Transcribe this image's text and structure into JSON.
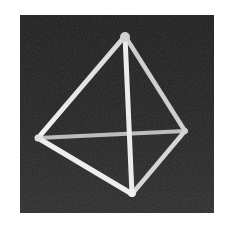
{
  "image": {
    "subject": "wireframe tetrahedron",
    "alt": "Photograph of a white wireframe tetrahedron (triangular pyramid) on a dark background",
    "background_color": "#222222",
    "frame_color": "#ffffff",
    "rod_color": "#e8e8e8"
  },
  "tetrahedron": {
    "vertices": {
      "top": [
        105,
        21
      ],
      "left": [
        18,
        123
      ],
      "right": [
        165,
        116
      ],
      "bottom": [
        112,
        179
      ]
    },
    "edges": [
      [
        "top",
        "left"
      ],
      [
        "top",
        "right"
      ],
      [
        "top",
        "bottom"
      ],
      [
        "left",
        "right"
      ],
      [
        "left",
        "bottom"
      ],
      [
        "right",
        "bottom"
      ]
    ]
  }
}
